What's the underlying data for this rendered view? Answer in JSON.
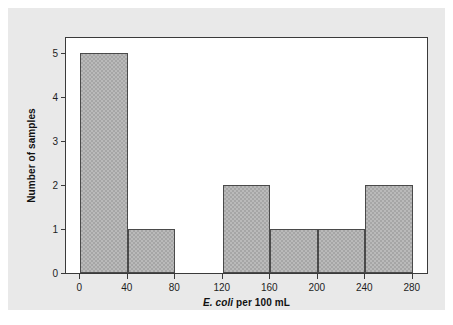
{
  "figure": {
    "background_color": "#e9e9e9",
    "page_color": "#ffffff",
    "plot_background_color": "#ffffff",
    "frame_color": "#3a3a3a"
  },
  "chart_data": {
    "type": "bar",
    "title": "",
    "xlabel_species": "E. coli",
    "xlabel_rest": " per 100 mL",
    "xlabel": "E. coli per 100 mL",
    "ylabel": "Number of samples",
    "bin_width": 40,
    "bin_edges": [
      0,
      40,
      80,
      120,
      160,
      200,
      240,
      280
    ],
    "categories": [
      "0-40",
      "40-80",
      "80-120",
      "120-160",
      "160-200",
      "200-240",
      "240-280"
    ],
    "values": [
      5,
      1,
      0,
      2,
      1,
      1,
      2
    ],
    "bars": [
      {
        "left": 0,
        "right": 40,
        "count": 5
      },
      {
        "left": 40,
        "right": 80,
        "count": 1
      },
      {
        "left": 80,
        "right": 120,
        "count": 0
      },
      {
        "left": 120,
        "right": 160,
        "count": 2
      },
      {
        "left": 160,
        "right": 200,
        "count": 1
      },
      {
        "left": 200,
        "right": 240,
        "count": 1
      },
      {
        "left": 240,
        "right": 280,
        "count": 2
      }
    ],
    "xlim": [
      -12,
      292
    ],
    "ylim": [
      0,
      5.35
    ],
    "xticks": [
      0,
      40,
      80,
      120,
      160,
      200,
      240,
      280
    ],
    "xtick_labels": [
      "0",
      "40",
      "80",
      "120",
      "160",
      "200",
      "240",
      "280"
    ],
    "yticks": [
      0,
      1,
      2,
      3,
      4,
      5
    ],
    "ytick_labels": [
      "0",
      "1",
      "2",
      "3",
      "4",
      "5"
    ],
    "grid": false,
    "legend": null,
    "bar_fill_color": "#a6a6a6",
    "bar_edge_color": "#4a4a4a"
  }
}
